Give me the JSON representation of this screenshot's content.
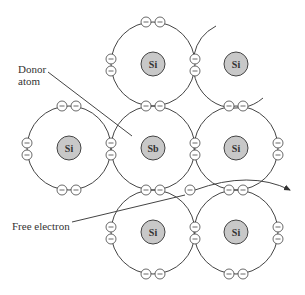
{
  "labels": {
    "donor": [
      "Donor",
      "atom"
    ],
    "free_electron": "Free electron"
  },
  "atoms": [
    {
      "symbol": "Si",
      "x": 153,
      "y": 64
    },
    {
      "symbol": "Si",
      "x": 236,
      "y": 64
    },
    {
      "symbol": "Si",
      "x": 69,
      "y": 148
    },
    {
      "symbol": "Sb",
      "x": 153,
      "y": 148
    },
    {
      "symbol": "Si",
      "x": 236,
      "y": 148
    },
    {
      "symbol": "Si",
      "x": 153,
      "y": 232
    },
    {
      "symbol": "Si",
      "x": 236,
      "y": 232
    }
  ],
  "electron_glyph": "−",
  "colors": {
    "nucleus_fill": "#c8c8c8",
    "stroke": "#444444"
  }
}
